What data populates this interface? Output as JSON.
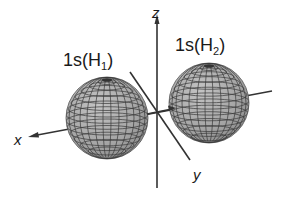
{
  "diagram": {
    "type": "orbital-overlap-3d",
    "axes": {
      "x_label": "x",
      "y_label": "y",
      "z_label": "z"
    },
    "orbitals": [
      {
        "label_main": "1s(H",
        "label_sub": "1",
        "label_close": ")"
      },
      {
        "label_main": "1s(H",
        "label_sub": "2",
        "label_close": ")"
      }
    ],
    "colors": {
      "sphere_fill": "#a8a8a8",
      "sphere_grid": "#3a3a3a",
      "axis": "#333333",
      "text": "#1a1a1a",
      "background": "#ffffff"
    }
  }
}
